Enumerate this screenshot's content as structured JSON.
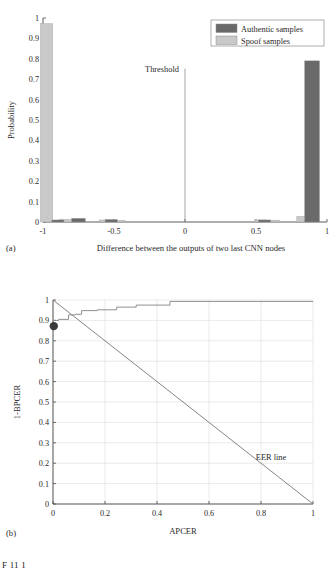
{
  "figure": {
    "caption_partial": "F 11 1",
    "panel_a_label": "(a)",
    "panel_b_label": "(b)"
  },
  "chart_data": [
    {
      "type": "bar",
      "panel": "(a)",
      "title": "",
      "xlabel": "Difference between the outputs of two last CNN nodes",
      "ylabel": "Probability",
      "xlim": [
        -1,
        1
      ],
      "ylim": [
        0,
        1
      ],
      "xticks": [
        "-1",
        "-0.5",
        "0",
        "0.5",
        "1"
      ],
      "xtick_values": [
        -1,
        -0.5,
        0,
        0.5,
        1
      ],
      "yticks": [
        "0",
        "0.1",
        "0.2",
        "0.3",
        "0.4",
        "0.5",
        "0.6",
        "0.7",
        "0.8",
        "0.9",
        "1"
      ],
      "ytick_values": [
        0,
        0.1,
        0.2,
        0.3,
        0.4,
        0.5,
        0.6,
        0.7,
        0.8,
        0.9,
        1
      ],
      "grid": false,
      "legend_position": "top-right",
      "legend": [
        "Authentic samples",
        "Spoof samples"
      ],
      "annotations": [
        {
          "text": "Threshold",
          "x": 0,
          "y": 0.75,
          "type": "vertical-line-label"
        }
      ],
      "threshold_line_x": 0,
      "series": [
        {
          "name": "Spoof samples",
          "color": "#c9c9c9",
          "bars": [
            {
              "x": -0.975,
              "width": 0.085,
              "value": 0.972
            },
            {
              "x": -0.84,
              "width": 0.085,
              "value": 0.012
            },
            {
              "x": -0.745,
              "width": 0.085,
              "value": 0.006
            },
            {
              "x": -0.56,
              "width": 0.085,
              "value": 0.01
            },
            {
              "x": -0.465,
              "width": 0.085,
              "value": 0.008
            },
            {
              "x": 0.53,
              "width": 0.085,
              "value": 0.01
            },
            {
              "x": 0.625,
              "width": 0.085,
              "value": 0.009
            },
            {
              "x": 0.83,
              "width": 0.085,
              "value": 0.027
            }
          ]
        },
        {
          "name": "Authentic samples",
          "color": "#6a6a6a",
          "bars": [
            {
              "x": -0.895,
              "width": 0.085,
              "value": 0.01
            },
            {
              "x": -0.75,
              "width": 0.095,
              "value": 0.018
            },
            {
              "x": -0.52,
              "width": 0.085,
              "value": 0.012
            },
            {
              "x": 0.56,
              "width": 0.085,
              "value": 0.01
            },
            {
              "x": 0.895,
              "width": 0.105,
              "value": 0.79
            }
          ]
        }
      ]
    },
    {
      "type": "line",
      "panel": "(b)",
      "title": "",
      "xlabel": "APCER",
      "ylabel": "1-BPCER",
      "xlim": [
        0,
        1
      ],
      "ylim": [
        0,
        1
      ],
      "xticks": [
        "0",
        "0.2",
        "0.4",
        "0.6",
        "0.8",
        "1"
      ],
      "xtick_values": [
        0,
        0.2,
        0.4,
        0.6,
        0.8,
        1
      ],
      "yticks": [
        "0",
        "0.1",
        "0.2",
        "0.3",
        "0.4",
        "0.5",
        "0.6",
        "0.7",
        "0.8",
        "0.9",
        "1"
      ],
      "ytick_values": [
        0,
        0.1,
        0.2,
        0.3,
        0.4,
        0.5,
        0.6,
        0.7,
        0.8,
        0.9,
        1
      ],
      "grid": true,
      "legend_position": "none",
      "annotations": [
        {
          "text": "EER line",
          "x": 0.78,
          "y": 0.215,
          "type": "line-label"
        }
      ],
      "series": [
        {
          "name": "ROC curve",
          "color": "#8a8a8a",
          "style": "step",
          "points": [
            [
              0.0,
              0.872
            ],
            [
              0.0,
              0.9
            ],
            [
              0.022,
              0.9
            ],
            [
              0.022,
              0.905
            ],
            [
              0.06,
              0.905
            ],
            [
              0.06,
              0.927
            ],
            [
              0.085,
              0.927
            ],
            [
              0.085,
              0.93
            ],
            [
              0.11,
              0.93
            ],
            [
              0.11,
              0.948
            ],
            [
              0.17,
              0.948
            ],
            [
              0.17,
              0.952
            ],
            [
              0.245,
              0.952
            ],
            [
              0.245,
              0.965
            ],
            [
              0.32,
              0.965
            ],
            [
              0.32,
              0.975
            ],
            [
              0.45,
              0.975
            ],
            [
              0.45,
              0.993
            ],
            [
              1.0,
              0.993
            ]
          ]
        },
        {
          "name": "EER line",
          "color": "#6f6f6f",
          "style": "solid-diagonal",
          "points": [
            [
              0,
              1
            ],
            [
              1,
              0
            ]
          ]
        }
      ],
      "markers": [
        {
          "name": "operating-point",
          "x": 0.003,
          "y": 0.872,
          "color": "#3a3a3a",
          "radius": 4.2
        }
      ]
    }
  ]
}
